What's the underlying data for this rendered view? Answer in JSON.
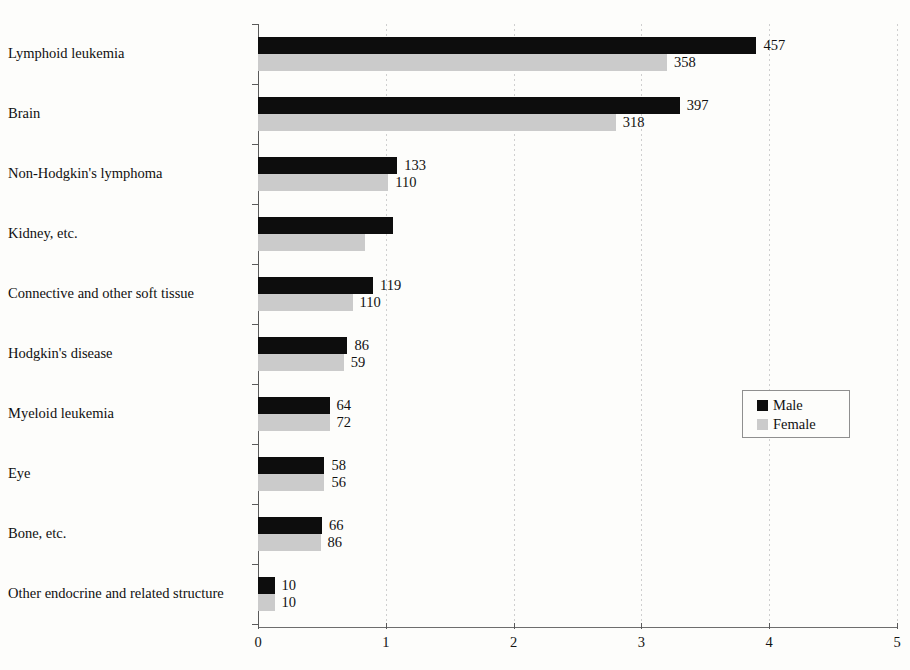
{
  "chart_data": {
    "type": "bar",
    "orientation": "horizontal",
    "grouped": true,
    "title": "",
    "subtitle": "",
    "xlabel": "",
    "ylabel": "",
    "xlim": [
      0,
      5
    ],
    "xticks": [
      "0",
      "1",
      "2",
      "3",
      "4",
      "5"
    ],
    "grid": "vertical-dotted",
    "legend_position": "middle-right",
    "categories": [
      "Lymphoid leukemia",
      "Brain",
      "Non-Hodgkin's lymphoma",
      "Kidney, etc.",
      "Connective and other soft tissue",
      "Hodgkin's disease",
      "Myeloid leukemia",
      "Eye",
      "Bone, etc.",
      "Other endocrine and related structure"
    ],
    "series": [
      {
        "name": "Male",
        "color": "#0d0d0d",
        "values": [
          3.9,
          3.3,
          1.09,
          1.06,
          0.9,
          0.7,
          0.56,
          0.52,
          0.5,
          0.13
        ],
        "labels": [
          "457",
          "397",
          "133",
          "",
          "119",
          "86",
          "64",
          "58",
          "66",
          "10"
        ]
      },
      {
        "name": "Female",
        "color": "#cbcbcb",
        "values": [
          3.2,
          2.8,
          1.02,
          0.84,
          0.74,
          0.67,
          0.56,
          0.52,
          0.49,
          0.13
        ],
        "labels": [
          "358",
          "318",
          "110",
          "",
          "110",
          "59",
          "72",
          "56",
          "86",
          "10"
        ]
      }
    ],
    "legend": [
      "Male",
      "Female"
    ]
  },
  "legend": {
    "male_label": "Male",
    "female_label": "Female"
  }
}
